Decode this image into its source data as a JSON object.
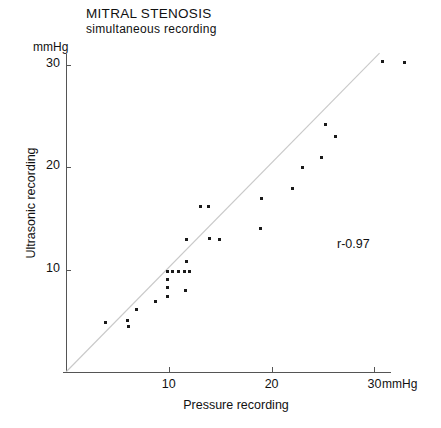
{
  "chart_data": {
    "type": "scatter",
    "title": "MITRAL STENOSIS",
    "subtitle": "simultaneous recording",
    "xlabel": "Pressure recording",
    "ylabel": "Ultrasonic recording",
    "x_unit": "mmHg",
    "y_unit": "mmHg",
    "xlim": [
      0,
      33
    ],
    "ylim": [
      0,
      31
    ],
    "xticks": [
      10,
      20,
      30
    ],
    "yticks": [
      10,
      20,
      30
    ],
    "grid": false,
    "legend": null,
    "annotations": [
      {
        "text": "r-0.97",
        "x": 26.5,
        "y": 13.2
      }
    ],
    "reference_line": {
      "type": "identity",
      "label": "line of identity (y = x)",
      "from": [
        0,
        0
      ],
      "to": [
        30.5,
        31.1
      ]
    },
    "series": [
      {
        "name": "simultaneous recording",
        "marker": "square",
        "color": "#1a1a1a",
        "points": [
          [
            3.8,
            4.8
          ],
          [
            6.0,
            5.0
          ],
          [
            6.1,
            4.4
          ],
          [
            6.9,
            6.1
          ],
          [
            8.7,
            6.9
          ],
          [
            9.9,
            9.8
          ],
          [
            9.9,
            9.0
          ],
          [
            9.9,
            8.2
          ],
          [
            9.9,
            7.4
          ],
          [
            10.4,
            9.8
          ],
          [
            10.9,
            9.8
          ],
          [
            11.5,
            9.8
          ],
          [
            11.6,
            8.0
          ],
          [
            12.0,
            9.8
          ],
          [
            11.7,
            10.8
          ],
          [
            11.7,
            12.9
          ],
          [
            13.1,
            16.1
          ],
          [
            14.0,
            13.0
          ],
          [
            13.9,
            16.1
          ],
          [
            14.9,
            12.9
          ],
          [
            18.9,
            14.0
          ],
          [
            19.0,
            16.9
          ],
          [
            22.0,
            17.9
          ],
          [
            23.0,
            20.0
          ],
          [
            24.9,
            20.9
          ],
          [
            25.2,
            24.1
          ],
          [
            26.2,
            23.0
          ],
          [
            30.8,
            30.3
          ],
          [
            32.9,
            30.2
          ]
        ]
      }
    ]
  },
  "axes": {
    "y_tick_labels": [
      "30",
      "20",
      "10"
    ],
    "x_tick_labels": [
      "10",
      "20",
      "30"
    ]
  }
}
